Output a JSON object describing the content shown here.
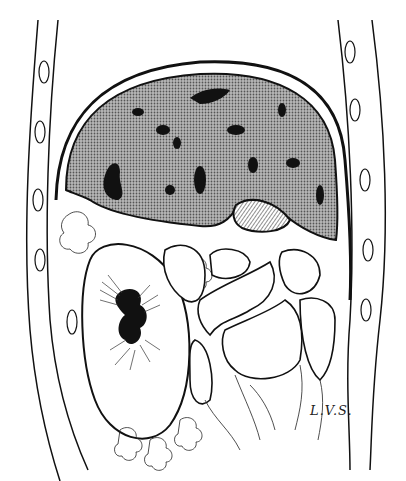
{
  "illustration": {
    "subject": "anatomical cross-section drawing",
    "signature": "L.V.S.",
    "colors": {
      "ink": "#111111",
      "stipple": "#8a8a8a",
      "paper": "#ffffff"
    }
  }
}
